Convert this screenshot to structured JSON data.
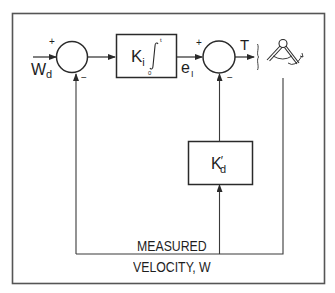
{
  "diagram": {
    "type": "control-block-diagram",
    "colors": {
      "line": "#3a3a3a",
      "frame": "#555555",
      "text": "#1e1e1e",
      "background": "#ffffff"
    },
    "input": {
      "symbol": "W",
      "subscript": "d"
    },
    "summing_junction_1": {
      "plus_sign": "+",
      "minus_sign": "−"
    },
    "integrator_block": {
      "gain": "K",
      "gain_subscript": "i",
      "integral_symbol": "∫",
      "upper_limit": "t",
      "lower_limit": "0"
    },
    "error_signal": {
      "symbol": "e",
      "subscript": "I"
    },
    "summing_junction_2": {
      "plus_sign": "+",
      "minus_sign": "−"
    },
    "output": {
      "symbol": "T"
    },
    "plant_icon": "robot-joint-icon",
    "derivative_block": {
      "gain": "K",
      "prime": "′",
      "gain_subscript": "d"
    },
    "feedback_label": {
      "line1": "MEASURED",
      "line2": "VELOCITY, W"
    }
  }
}
